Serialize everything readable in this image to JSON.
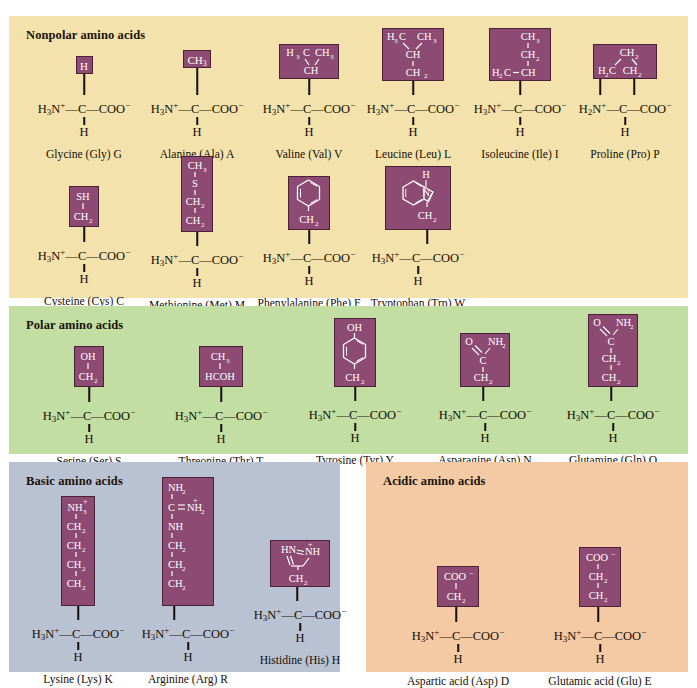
{
  "figure": {
    "colors": {
      "nonpolar_bg": "#f4e2ac",
      "polar_bg": "#c3dea2",
      "basic_bg": "#b9c2d2",
      "acidic_bg": "#f3caa3",
      "sidegroup_fill": "#8d4a72",
      "sidegroup_border": "#4a2136",
      "text": "#160f06",
      "page_bg": "#ffffff"
    }
  },
  "sections": [
    {
      "id": "nonpolar",
      "title": "Nonpolar amino acids"
    },
    {
      "id": "polar",
      "title": "Polar amino acids"
    },
    {
      "id": "basic",
      "title": "Basic amino acids"
    },
    {
      "id": "acidic",
      "title": "Acidic amino acids"
    }
  ],
  "backbone": {
    "amine": "H3N+",
    "amine_proline": "H2N+",
    "alpha_carbon": "C",
    "carboxylate": "COO-",
    "alpha_hydrogen": "H"
  },
  "amino_acids": {
    "glycine": {
      "name": "Glycine (Gly) G",
      "side_chain": "H",
      "section": "nonpolar"
    },
    "alanine": {
      "name": "Alanine (Ala) A",
      "side_chain": "CH3",
      "section": "nonpolar"
    },
    "valine": {
      "name": "Valine (Val) V",
      "side_chain": "H3C CH3 / CH",
      "section": "nonpolar"
    },
    "leucine": {
      "name": "Leucine (Leu) L",
      "side_chain": "H3C CH3 / CH / CH2",
      "section": "nonpolar"
    },
    "isoleucine": {
      "name": "Isoleucine (Ile) I",
      "side_chain": "CH3 / CH2 / H3C-CH",
      "section": "nonpolar"
    },
    "proline": {
      "name": "Proline (Pro) P",
      "side_chain": "CH2 / H2C CH2",
      "section": "nonpolar"
    },
    "cysteine": {
      "name": "Cysteine (Cys) C",
      "side_chain": "SH / CH2",
      "section": "nonpolar"
    },
    "methionine": {
      "name": "Methionine (Met) M",
      "side_chain": "CH3 / S / CH2 / CH2",
      "section": "nonpolar"
    },
    "phenylalanine": {
      "name": "Phenylalanine (Phe) F",
      "side_chain": "benzene ring / CH2",
      "section": "nonpolar"
    },
    "tryptophan": {
      "name": "Tryptophan (Trp) W",
      "side_chain": "indole ring (NH) / CH2",
      "section": "nonpolar"
    },
    "serine": {
      "name": "Serine (Ser) S",
      "side_chain": "OH / CH2",
      "section": "polar"
    },
    "threonine": {
      "name": "Threonine (Thr) T",
      "side_chain": "CH3 / HCOH",
      "section": "polar"
    },
    "tyrosine": {
      "name": "Tyrosine (Tyr) Y",
      "side_chain": "OH / phenol ring / CH2",
      "section": "polar"
    },
    "asparagine": {
      "name": "Asparagine (Asn) N",
      "side_chain": "O NH2 / C / CH2",
      "section": "polar"
    },
    "glutamine": {
      "name": "Glutamine (Gln) Q",
      "side_chain": "O NH2 / C / CH2 / CH2",
      "section": "polar"
    },
    "lysine": {
      "name": "Lysine (Lys) K",
      "side_chain": "NH3+ / CH2 / CH2 / CH2 / CH2",
      "section": "basic"
    },
    "arginine": {
      "name": "Arginine (Arg) R",
      "side_chain": "NH2 / C=NH2+ / NH / CH2 / CH2 / CH2",
      "section": "basic"
    },
    "histidine": {
      "name": "Histidine (His) H",
      "side_chain": "imidazole ring (HN, +NH) / CH2",
      "section": "basic"
    },
    "aspartic_acid": {
      "name": "Aspartic acid (Asp) D",
      "side_chain": "COO- / CH2",
      "section": "acidic"
    },
    "glutamic_acid": {
      "name": "Glutamic acid (Glu) E",
      "side_chain": "COO- / CH2 / CH2",
      "section": "acidic"
    }
  },
  "labels": {
    "H": "H",
    "CH3": "CH",
    "CH2": "CH",
    "OH": "OH",
    "SH": "SH",
    "S": "S",
    "NH": "NH",
    "NH2": "NH",
    "NH3": "NH",
    "HCOH": "HCOH",
    "O": "O",
    "COO": "COO",
    "C": "C",
    "H3C": "H",
    "H2C": "H",
    "CH": "CH"
  }
}
